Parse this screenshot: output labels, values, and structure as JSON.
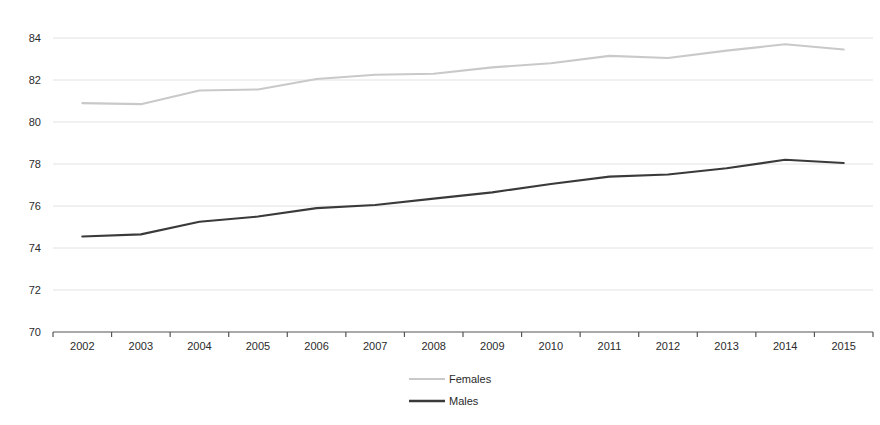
{
  "chart_data": {
    "type": "line",
    "title": "",
    "subtitle": "",
    "xlabel": "",
    "ylabel": "",
    "categories": [
      "2002",
      "2003",
      "2004",
      "2005",
      "2006",
      "2007",
      "2008",
      "2009",
      "2010",
      "2011",
      "2012",
      "2013",
      "2014",
      "2015"
    ],
    "series": [
      {
        "name": "Females",
        "color": "#c9c9c9",
        "values": [
          80.9,
          80.85,
          81.5,
          81.55,
          82.05,
          82.25,
          82.3,
          82.6,
          82.8,
          83.15,
          83.05,
          83.4,
          83.7,
          83.45
        ]
      },
      {
        "name": "Males",
        "color": "#3a3a3a",
        "values": [
          74.55,
          74.65,
          75.25,
          75.5,
          75.9,
          76.05,
          76.35,
          76.65,
          77.05,
          77.4,
          77.5,
          77.8,
          78.2,
          78.05
        ]
      }
    ],
    "ylim": [
      70,
      84
    ],
    "yticks": [
      70,
      72,
      74,
      76,
      78,
      80,
      82,
      84
    ],
    "ytick_labels": [
      "70",
      "72",
      "74",
      "76",
      "78",
      "80",
      "82",
      "84"
    ],
    "grid": true,
    "grid_axis": "y",
    "legend_position": "bottom",
    "legend_entries": [
      {
        "label": "Females",
        "color": "#c9c9c9"
      },
      {
        "label": "Males",
        "color": "#3a3a3a"
      }
    ]
  },
  "colors": {
    "gridline": "#e2e2e2",
    "axis": "#555555",
    "text": "#2b2b2b",
    "females": "#c9c9c9",
    "males": "#3a3a3a",
    "background": "#ffffff"
  }
}
